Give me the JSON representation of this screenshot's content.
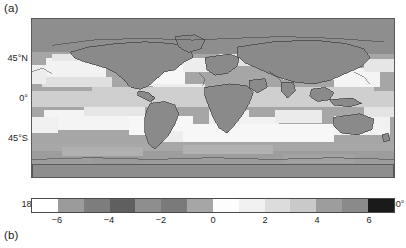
{
  "figure": {
    "panel_a_label": "(a)",
    "panel_b_label": "(b)"
  },
  "chart_data": {
    "type": "heatmap",
    "title": "",
    "subtitle": "",
    "xlabel": "",
    "ylabel": "",
    "projection": "equirectangular",
    "grid": false,
    "legend_position": "bottom",
    "xlim": [
      -180,
      180
    ],
    "ylim": [
      -90,
      90
    ],
    "x_ticks": [
      -180,
      -90,
      0,
      90,
      180
    ],
    "x_tick_labels": [
      "180°",
      "90°W",
      "0°",
      "90°E",
      "180°"
    ],
    "y_ticks": [
      45,
      0,
      -45
    ],
    "y_tick_labels": [
      "45°N",
      "0°",
      "45°S"
    ],
    "colorbar": {
      "orientation": "horizontal",
      "ticks": [
        -6,
        -4,
        -2,
        0,
        2,
        4,
        6
      ],
      "tick_labels": [
        "−6",
        "−4",
        "−2",
        "0",
        "2",
        "4",
        "6"
      ],
      "vmin": -7,
      "vmax": 7,
      "n_levels": 14,
      "level_edges": [
        -7,
        -6,
        -5,
        -4,
        -3,
        -2,
        -1,
        0,
        1,
        2,
        3,
        4,
        5,
        6,
        7
      ],
      "colors": [
        "#ffffff",
        "#9b9b9b",
        "#7d7d7d",
        "#5f5f5f",
        "#8e8e8e",
        "#7a7a7a",
        "#a6a6a6",
        "#fdfdfd",
        "#f0f0f0",
        "#dcdcdc",
        "#c9c9c9",
        "#9d9d9d",
        "#8a8a8a",
        "#1a1a1a"
      ]
    },
    "field_values": {
      "ocean_background": -1,
      "land_background": -2,
      "tropical_pacific_band": 1,
      "subtropical_bands": 2,
      "southern_ocean_band": 3,
      "polar_south": -1,
      "north_atlantic_patch": 2
    }
  }
}
